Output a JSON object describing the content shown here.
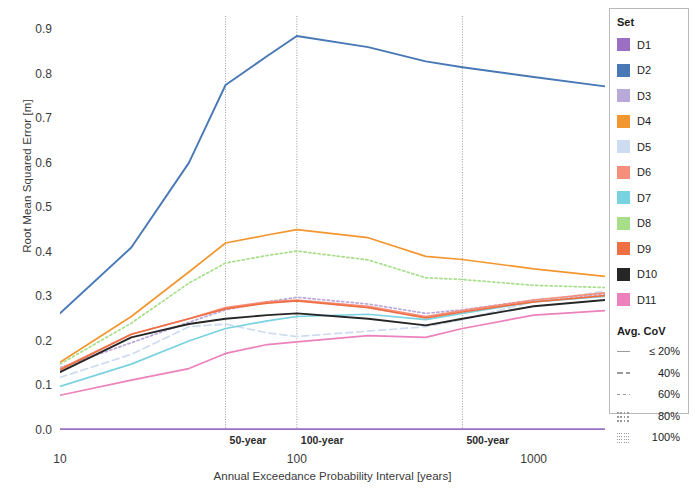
{
  "chart_data": {
    "type": "line",
    "title": "",
    "xlabel": "Annual Exceedance Probability Interval [years]",
    "ylabel": "Root Mean Squared Error [m]",
    "xscale": "log",
    "xlim": [
      10,
      2000
    ],
    "ylim": [
      0.0,
      0.93
    ],
    "yticks": [
      "0.0",
      "0.1",
      "0.2",
      "0.3",
      "0.4",
      "0.5",
      "0.6",
      "0.7",
      "0.8",
      "0.9"
    ],
    "ytick_values": [
      0.0,
      0.1,
      0.2,
      0.3,
      0.4,
      0.5,
      0.6,
      0.7,
      0.8,
      0.9
    ],
    "xticks": [
      "10",
      "100",
      "1000"
    ],
    "xtick_values": [
      10,
      100,
      1000
    ],
    "grid": false,
    "legend_position": "right",
    "reference_lines": [
      {
        "label": "50-year",
        "x": 50
      },
      {
        "label": "100-year",
        "x": 100
      },
      {
        "label": "500-year",
        "x": 500
      }
    ],
    "x": [
      10,
      20,
      35,
      50,
      75,
      100,
      200,
      350,
      500,
      1000,
      2000
    ],
    "series": [
      {
        "name": "D1",
        "color": "#9b6fc4",
        "dash": "solid",
        "values": [
          0.002,
          0.002,
          0.002,
          0.002,
          0.002,
          0.002,
          0.002,
          0.002,
          0.002,
          0.002,
          0.002
        ]
      },
      {
        "name": "D2",
        "color": "#4878b6",
        "dash": "solid",
        "values": [
          0.262,
          0.41,
          0.6,
          0.775,
          0.84,
          0.885,
          0.86,
          0.828,
          0.815,
          0.793,
          0.772
        ]
      },
      {
        "name": "D3",
        "color": "#b8a9d9",
        "dash": "dotted",
        "values": [
          0.14,
          0.196,
          0.242,
          0.27,
          0.288,
          0.298,
          0.283,
          0.262,
          0.27,
          0.292,
          0.305
        ]
      },
      {
        "name": "D4",
        "color": "#f2962f",
        "dash": "solid",
        "values": [
          0.152,
          0.255,
          0.355,
          0.42,
          0.438,
          0.45,
          0.432,
          0.39,
          0.383,
          0.362,
          0.345
        ]
      },
      {
        "name": "D5",
        "color": "#cddcf0",
        "dash": "dashed",
        "values": [
          0.118,
          0.17,
          0.232,
          0.238,
          0.218,
          0.21,
          0.222,
          0.232,
          0.248,
          0.288,
          0.312
        ]
      },
      {
        "name": "D6",
        "color": "#f58f7c",
        "dash": "solid",
        "values": [
          0.137,
          0.215,
          0.25,
          0.275,
          0.288,
          0.292,
          0.278,
          0.255,
          0.268,
          0.292,
          0.308
        ]
      },
      {
        "name": "D7",
        "color": "#79d2e0",
        "dash": "solid",
        "values": [
          0.098,
          0.148,
          0.2,
          0.228,
          0.245,
          0.255,
          0.26,
          0.248,
          0.262,
          0.288,
          0.3
        ]
      },
      {
        "name": "D8",
        "color": "#a7de8a",
        "dash": "dotted",
        "values": [
          0.148,
          0.24,
          0.33,
          0.375,
          0.392,
          0.402,
          0.382,
          0.342,
          0.338,
          0.325,
          0.32
        ]
      },
      {
        "name": "D9",
        "color": "#ef6f45",
        "dash": "solid",
        "values": [
          0.135,
          0.215,
          0.25,
          0.272,
          0.285,
          0.29,
          0.275,
          0.252,
          0.265,
          0.288,
          0.302
        ]
      },
      {
        "name": "D10",
        "color": "#262626",
        "dash": "solid",
        "values": [
          0.13,
          0.208,
          0.238,
          0.25,
          0.258,
          0.262,
          0.25,
          0.235,
          0.25,
          0.278,
          0.292
        ]
      },
      {
        "name": "D11",
        "color": "#ec81bc",
        "dash": "solid",
        "values": [
          0.078,
          0.112,
          0.138,
          0.172,
          0.192,
          0.198,
          0.212,
          0.208,
          0.228,
          0.258,
          0.268
        ]
      }
    ]
  },
  "legend": {
    "set_title": "Set",
    "cov_title": "Avg. CoV",
    "set_items": [
      {
        "label": "D1",
        "color": "#9b6fc4"
      },
      {
        "label": "D2",
        "color": "#4878b6"
      },
      {
        "label": "D3",
        "color": "#b8a9d9"
      },
      {
        "label": "D4",
        "color": "#f2962f"
      },
      {
        "label": "D5",
        "color": "#cddcf0"
      },
      {
        "label": "D6",
        "color": "#f58f7c"
      },
      {
        "label": "D7",
        "color": "#79d2e0"
      },
      {
        "label": "D8",
        "color": "#a7de8a"
      },
      {
        "label": "D9",
        "color": "#ef6f45"
      },
      {
        "label": "D10",
        "color": "#262626"
      },
      {
        "label": "D11",
        "color": "#ec81bc"
      }
    ],
    "cov_items": [
      {
        "label": "≤ 20%",
        "pattern": "solid"
      },
      {
        "label": "40%",
        "pattern": "longdash"
      },
      {
        "label": "60%",
        "pattern": "dashed"
      },
      {
        "label": "80%",
        "pattern": "dotted"
      },
      {
        "label": "100%",
        "pattern": "finedot"
      }
    ]
  }
}
